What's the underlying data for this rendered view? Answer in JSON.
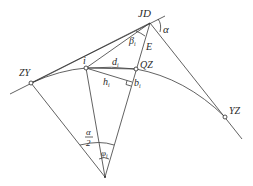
{
  "diagram": {
    "title": "",
    "points": {
      "JD": {
        "label": "JD",
        "x": 150,
        "y": 23
      },
      "ZY": {
        "label": "ZY",
        "x": 31,
        "y": 83
      },
      "YZ": {
        "label": "YZ",
        "x": 225,
        "y": 117
      },
      "QZ": {
        "label": "QZ",
        "x": 136,
        "y": 69
      },
      "i": {
        "label": "i",
        "x": 86,
        "y": 68
      },
      "center": {
        "label": "",
        "x": 105,
        "y": 177
      }
    },
    "labels": {
      "alpha": "α",
      "beta_main": "β",
      "beta_sub": "i",
      "E": "E",
      "d_main": "d",
      "d_sub": "i",
      "h_main": "h",
      "h_sub": "i",
      "b_main": "b",
      "b_sub": "i",
      "half_alpha_num": "α",
      "half_alpha_den": "2",
      "phi_main": "φ",
      "phi_sub": "i"
    },
    "colors": {
      "stroke": "#3a3a3a",
      "text": "#2a2a2a",
      "background": "#ffffff"
    }
  }
}
